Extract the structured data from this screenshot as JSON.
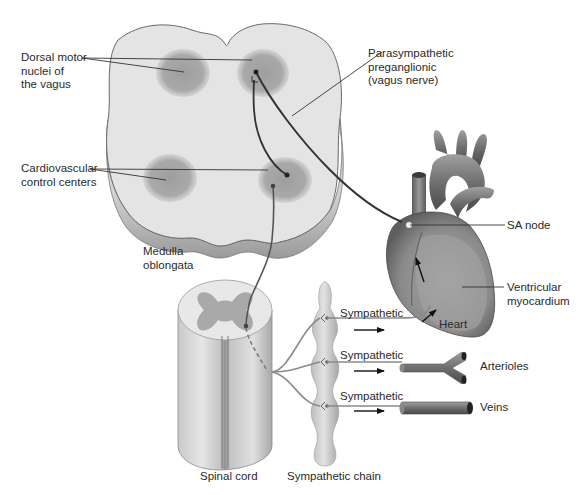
{
  "diagram": {
    "type": "anatomical-schematic",
    "colors": {
      "background": "#ffffff",
      "tissue_light": "#e4e4e4",
      "nucleus_dark": "#a8a8a8",
      "nerve_dark": "#333333",
      "nerve_gray": "#8a8a8a",
      "heart_fill": "#8c8c8c",
      "vessel_fill": "#7a7a7a"
    }
  },
  "labels": {
    "dorsal_motor": "Dorsal motor\nnuclei of\nthe vagus",
    "cardiovascular_centers": "Cardiovascular\ncontrol centers",
    "medulla": "Medulla\noblongata",
    "parasympathetic": "Parasympathetic\npreganglionic\n(vagus nerve)",
    "sa_node": "SA node",
    "ventricular": "Ventricular\nmyocardium",
    "heart": "Heart",
    "sympathetic_1": "Sympathetic",
    "sympathetic_2": "Sympathetic",
    "sympathetic_3": "Sympathetic",
    "arterioles": "Arterioles",
    "veins": "Veins",
    "spinal_cord": "Spinal cord",
    "sympathetic_chain": "Sympathetic chain"
  },
  "structures": [
    {
      "name": "Medulla oblongata",
      "contains": [
        "Dorsal motor nuclei of the vagus",
        "Cardiovascular control centers"
      ]
    },
    {
      "name": "Spinal cord"
    },
    {
      "name": "Sympathetic chain"
    },
    {
      "name": "Heart",
      "parts": [
        "SA node",
        "Ventricular myocardium"
      ]
    },
    {
      "name": "Arterioles"
    },
    {
      "name": "Veins"
    }
  ],
  "pathways": [
    {
      "from": "Dorsal motor nuclei of the vagus",
      "to": "SA node",
      "type": "Parasympathetic preganglionic (vagus nerve)"
    },
    {
      "from": "Cardiovascular control centers",
      "to": "Spinal cord",
      "type": "descending"
    },
    {
      "from": "Sympathetic chain",
      "to": "Heart",
      "type": "Sympathetic"
    },
    {
      "from": "Sympathetic chain",
      "to": "Arterioles",
      "type": "Sympathetic"
    },
    {
      "from": "Sympathetic chain",
      "to": "Veins",
      "type": "Sympathetic"
    }
  ]
}
